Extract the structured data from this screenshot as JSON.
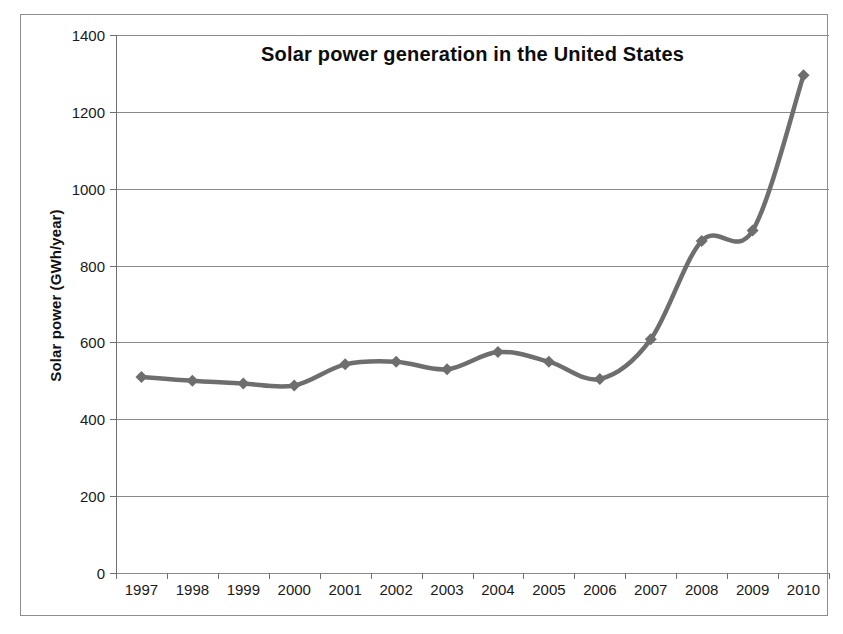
{
  "chart_data": {
    "type": "line",
    "title": "Solar power generation in the United States",
    "xlabel": "",
    "ylabel": "Solar power (GWh/year)",
    "categories": [
      "1997",
      "1998",
      "1999",
      "2000",
      "2001",
      "2002",
      "2003",
      "2004",
      "2005",
      "2006",
      "2007",
      "2008",
      "2009",
      "2010"
    ],
    "values": [
      510,
      500,
      493,
      488,
      543,
      550,
      530,
      575,
      550,
      505,
      608,
      864,
      891,
      1295
    ],
    "series": [
      {
        "name": "Solar power generation",
        "values": [
          510,
          500,
          493,
          488,
          543,
          550,
          530,
          575,
          550,
          505,
          608,
          864,
          891,
          1295
        ]
      }
    ],
    "ylim": [
      0,
      1400
    ],
    "y_ticks": [
      0,
      200,
      400,
      600,
      800,
      1000,
      1200,
      1400
    ],
    "y_tick_labels": [
      "0",
      "200",
      "400",
      "600",
      "800",
      "1000",
      "1200",
      "1400"
    ],
    "grid": true,
    "legend": false,
    "legend_position": "none",
    "marker": "diamond",
    "smoothed": true,
    "series_color": "#6e6e6e",
    "gridline_color": "#8a8a8a",
    "axis_color": "#6f6f6f",
    "frame_color": "#8e8e8e",
    "text_color": "#1a1a1a",
    "background_color": "#ffffff"
  }
}
